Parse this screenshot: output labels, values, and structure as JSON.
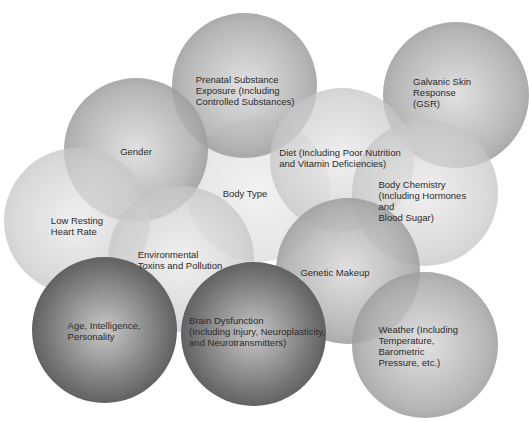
{
  "diagram": {
    "type": "overlapping-circles",
    "nodes": [
      {
        "id": "prenatal",
        "label": "Prenatal Substance\nExposure (Including\nControlled Substances)"
      },
      {
        "id": "galvanic",
        "label": "Galvanic Skin\nResponse (GSR)"
      },
      {
        "id": "gender",
        "label": "Gender"
      },
      {
        "id": "diet",
        "label": "Diet (Including Poor Nutrition\nand Vitamin Deficiencies)"
      },
      {
        "id": "body_type",
        "label": "Body Type"
      },
      {
        "id": "body_chemistry",
        "label": "Body Chemistry\n(Including Hormones and\nBlood Sugar)"
      },
      {
        "id": "low_resting",
        "label": "Low Resting\nHeart Rate"
      },
      {
        "id": "environmental",
        "label": "Environmental\nToxins and Pollution"
      },
      {
        "id": "genetic",
        "label": "Genetic Makeup"
      },
      {
        "id": "age",
        "label": "Age, Intelligence,\nPersonality"
      },
      {
        "id": "brain",
        "label": "Brain Dysfunction\n(Including Injury, Neuroplasticity,\nand Neurotransmitters)"
      },
      {
        "id": "weather",
        "label": "Weather (Including\nTemperature, Barometric\nPressure, etc.)"
      }
    ],
    "colors": {
      "background": "#ffffff",
      "circle_mid": "#aaaaaa",
      "circle_dark": "#3a3a3a",
      "text": "#2a2a2a"
    }
  }
}
